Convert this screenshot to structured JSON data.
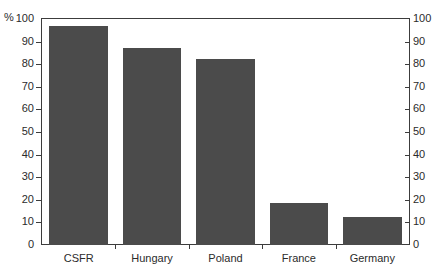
{
  "chart_data": {
    "type": "bar",
    "title": "",
    "xlabel": "",
    "ylabel": "%",
    "unit_symbol": "%",
    "categories": [
      "CSFR",
      "Hungary",
      "Poland",
      "France",
      "Germany"
    ],
    "values": [
      97,
      87,
      82.5,
      18.5,
      12.5
    ],
    "series": [
      {
        "name": "",
        "values": [
          97,
          87,
          82.5,
          18.5,
          12.5
        ]
      }
    ],
    "ylim": [
      0,
      100
    ],
    "yticks": [
      0,
      10,
      20,
      30,
      40,
      50,
      60,
      70,
      80,
      90,
      100
    ],
    "ytick_labels": [
      "0",
      "10",
      "20",
      "30",
      "40",
      "50",
      "60",
      "70",
      "80",
      "90",
      "100"
    ],
    "right_axis": {
      "ylim": [
        0,
        100
      ],
      "yticks": [
        0,
        10,
        20,
        30,
        40,
        50,
        60,
        70,
        80,
        90,
        100
      ],
      "ytick_labels": [
        "0",
        "10",
        "20",
        "30",
        "40",
        "50",
        "60",
        "70",
        "80",
        "90",
        "100"
      ]
    },
    "grid": false,
    "legend": null,
    "legend_position": "none",
    "bar_color": "#4b4b4b",
    "axis_color": "#3c3c3c",
    "background_color": "#ffffff"
  },
  "axes": {
    "left": {
      "percent_symbol": "%",
      "labels": [
        "100",
        "90",
        "80",
        "70",
        "60",
        "50",
        "40",
        "30",
        "20",
        "10",
        "0"
      ]
    },
    "right": {
      "labels": [
        "100",
        "90",
        "80",
        "70",
        "60",
        "50",
        "40",
        "30",
        "20",
        "10",
        "0"
      ]
    },
    "categories": [
      "CSFR",
      "Hungary",
      "Poland",
      "France",
      "Germany"
    ]
  }
}
